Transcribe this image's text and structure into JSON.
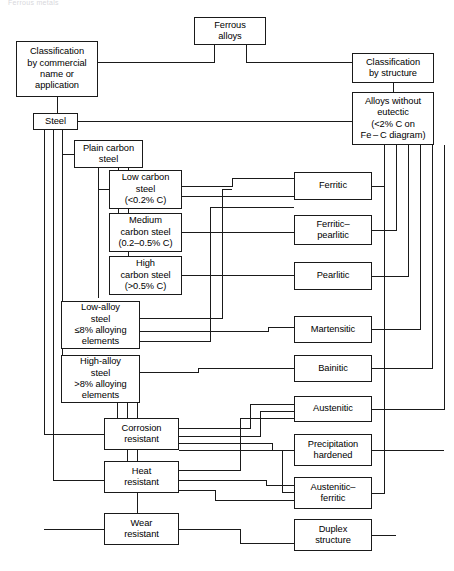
{
  "page": {
    "header_text": "Ferrous metals",
    "width": 454,
    "height": 571,
    "background": "#ffffff",
    "line_color": "#1a1a1a",
    "text_color": "#000000"
  },
  "diagram": {
    "type": "flowchart",
    "root": "Ferrous alloys",
    "branches": [
      "Classification by commercial name or application",
      "Classification by structure"
    ]
  },
  "nodes": {
    "ferrous_alloys": {
      "label": "Ferrous\nalloys",
      "x": 194,
      "y": 17,
      "w": 72,
      "h": 28
    },
    "class_commercial": {
      "label": "Classification\nby commercial\nname or\napplication",
      "x": 16,
      "y": 41,
      "w": 82,
      "h": 56
    },
    "class_structure": {
      "label": "Classification\nby structure",
      "x": 352,
      "y": 53,
      "w": 82,
      "h": 30
    },
    "alloys_no_eutectic": {
      "label": "Alloys without\neutectic\n(<2% C on\nFe – C diagram)",
      "x": 352,
      "y": 92,
      "w": 82,
      "h": 53
    },
    "steel": {
      "label": "Steel",
      "x": 33,
      "y": 113,
      "w": 45,
      "h": 17
    },
    "plain_carbon": {
      "label": "Plain carbon\nsteel",
      "x": 74,
      "y": 140,
      "w": 69,
      "h": 28
    },
    "low_carbon": {
      "label": "Low carbon\nsteel\n(<0.2% C)",
      "x": 109,
      "y": 170,
      "w": 73,
      "h": 39
    },
    "medium_carbon": {
      "label": "Medium\ncarbon steel\n(0.2–0.5% C)",
      "x": 109,
      "y": 213,
      "w": 73,
      "h": 39
    },
    "high_carbon": {
      "label": "High\ncarbon steel\n(>0.5% C)",
      "x": 109,
      "y": 256,
      "w": 73,
      "h": 39
    },
    "low_alloy": {
      "label": "Low-alloy\nsteel\n≤8% alloying\nelements",
      "x": 61,
      "y": 301,
      "w": 79,
      "h": 48
    },
    "high_alloy": {
      "label": "High-alloy\nsteel\n>8% alloying\nelements",
      "x": 61,
      "y": 355,
      "w": 79,
      "h": 48
    },
    "corrosion_resistant": {
      "label": "Corrosion\nresistant",
      "x": 104,
      "y": 418,
      "w": 75,
      "h": 32
    },
    "heat_resistant": {
      "label": "Heat\nresistant",
      "x": 104,
      "y": 461,
      "w": 75,
      "h": 32
    },
    "wear_resistant": {
      "label": "Wear\nresistant",
      "x": 104,
      "y": 513,
      "w": 75,
      "h": 32
    },
    "ferritic": {
      "label": "Ferritic",
      "x": 294,
      "y": 172,
      "w": 78,
      "h": 28
    },
    "ferritic_pearlitic": {
      "label": "Ferritic–\npearlitic",
      "x": 294,
      "y": 215,
      "w": 78,
      "h": 30
    },
    "pearlitic": {
      "label": "Pearlitic",
      "x": 294,
      "y": 262,
      "w": 78,
      "h": 28
    },
    "martensitic": {
      "label": "Martensitic",
      "x": 294,
      "y": 316,
      "w": 78,
      "h": 27
    },
    "bainitic": {
      "label": "Bainitic",
      "x": 294,
      "y": 355,
      "w": 78,
      "h": 27
    },
    "austenitic": {
      "label": "Austenitic",
      "x": 294,
      "y": 396,
      "w": 78,
      "h": 26
    },
    "precipitation": {
      "label": "Precipitation\nhardened",
      "x": 294,
      "y": 434,
      "w": 78,
      "h": 32
    },
    "austenitic_ferritic": {
      "label": "Austenitic–\nferritic",
      "x": 294,
      "y": 477,
      "w": 78,
      "h": 32
    },
    "duplex": {
      "label": "Duplex\nstructure",
      "x": 294,
      "y": 519,
      "w": 78,
      "h": 32
    }
  },
  "connector_paths": [
    "M 214 45 L 214 62 L 57 62 L 57 41",
    "M 246 45 L 246 62 L 352 62 L 352 68",
    "M 393 83 L 393 92",
    "M 57 97 L 57 113",
    "M 78 121 L 352 121",
    "M 44 130 L 44 434",
    "M 53 130 L 53 480",
    "M 62 130 L 62 355",
    "M 74 154 L 62 154",
    "M 98 168 L 98 298",
    "M 109 189 L 98 189",
    "M 118 168 L 118 232",
    "M 118 232 L 109 232",
    "M 128 168 L 128 275",
    "M 128 275 L 109 275",
    "M 44 434 L 104 434",
    "M 53 480 L 104 480",
    "M 44 529 L 104 529",
    "M 117 403 L 117 418",
    "M 127 403 L 127 461",
    "M 137 403 L 137 513",
    "M 182 186 L 232 186 L 232 178 L 294 178",
    "M 182 196 L 294 196",
    "M 182 232 L 294 232",
    "M 182 275 L 294 275",
    "M 140 318 L 222 318 L 222 189 L 232 189",
    "M 140 331 L 268 331 L 268 327 L 294 327",
    "M 140 341 L 210 341 L 210 207 L 294 207",
    "M 140 372 L 198 372 L 198 368 L 294 368",
    "M 179 428 L 250 428 L 250 404 L 294 404",
    "M 179 436 L 260 436 L 260 411 L 294 411",
    "M 179 443 L 272 443 L 272 450 L 294 450",
    "M 179 450 L 282 450 L 282 492 L 294 492",
    "M 179 470 L 240 470 L 240 418 L 294 418",
    "M 179 480 L 266 480 L 266 485 L 294 485",
    "M 179 490 L 215 490 L 215 500 L 294 500",
    "M 179 529 L 240 529 L 240 543 L 294 543",
    "M 372 186 L 384 186 L 384 145",
    "M 372 230 L 396 230 L 396 145",
    "M 372 276 L 408 276 L 408 145",
    "M 372 329 L 420 329 L 420 145",
    "M 372 368 L 432 368 L 432 145",
    "M 372 409 L 444 409 L 444 145",
    "M 372 450 L 444 450",
    "M 372 493 L 384 493 L 384 145",
    "M 372 535 L 396 535"
  ]
}
